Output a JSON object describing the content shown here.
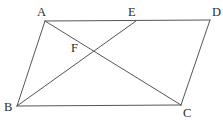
{
  "figure": {
    "type": "geometry-diagram",
    "background_color": "#ffffff",
    "stroke_color": "#555555",
    "label_color": "#2b2b2b",
    "stroke_width": 1,
    "canvas": {
      "width": 223,
      "height": 123
    },
    "points": {
      "A": {
        "label": "A",
        "x": 45,
        "y": 21,
        "label_x": 37,
        "label_y": 6
      },
      "B": {
        "label": "B",
        "x": 17,
        "y": 106,
        "label_x": 4,
        "label_y": 101
      },
      "C": {
        "label": "C",
        "x": 181,
        "y": 105,
        "label_x": 183,
        "label_y": 107
      },
      "D": {
        "label": "D",
        "x": 210,
        "y": 20,
        "label_x": 212,
        "label_y": 6
      },
      "E": {
        "label": "E",
        "x": 136,
        "y": 21,
        "label_x": 128,
        "label_y": 6
      },
      "F": {
        "label": "F",
        "x": 92,
        "y": 50,
        "label_x": 71,
        "label_y": 42
      }
    },
    "segments": [
      {
        "name": "side-AD",
        "from": "A",
        "to": "D"
      },
      {
        "name": "side-DC",
        "from": "D",
        "to": "C"
      },
      {
        "name": "side-CB",
        "from": "C",
        "to": "B"
      },
      {
        "name": "side-BA",
        "from": "B",
        "to": "A"
      },
      {
        "name": "diagonal-AC",
        "from": "A",
        "to": "C"
      },
      {
        "name": "segment-BE",
        "from": "B",
        "to": "E"
      }
    ]
  }
}
